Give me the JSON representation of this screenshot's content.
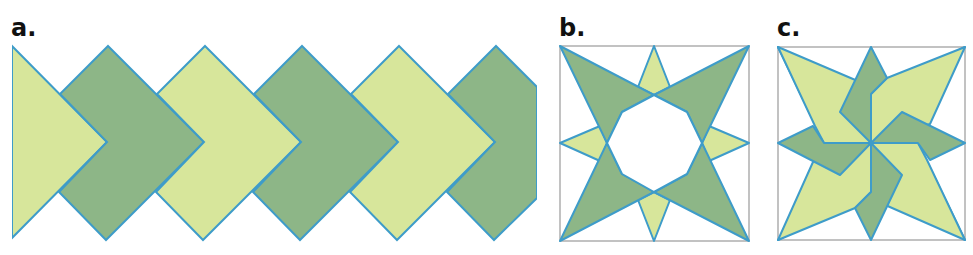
{
  "panels": [
    {
      "id": "a",
      "label": "a.",
      "description": "Chevron border pattern of alternating light and dark green arrow shapes"
    },
    {
      "id": "b",
      "label": "b.",
      "description": "Eight-pointed star block with octagonal center"
    },
    {
      "id": "c",
      "label": "c.",
      "description": "Pinwheel star block"
    }
  ],
  "colors": {
    "light_fill": "#d7e69b",
    "dark_fill": "#8db687",
    "stroke": "#3e9cc9",
    "frame": "#9a9a9a",
    "background": "#ffffff"
  }
}
